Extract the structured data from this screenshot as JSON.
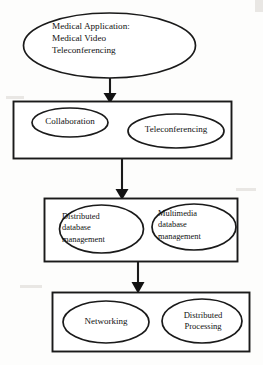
{
  "diagram": {
    "type": "flowchart",
    "orientation": "top-to-bottom",
    "title_node": "Medical Application: Medical Video Teleconferencing",
    "levels": [
      {
        "level": 1,
        "shape": "ellipse",
        "nodes": [
          {
            "id": "root-node",
            "label": "Medical Application:\nMedical Video\n Teleconferencing"
          }
        ]
      },
      {
        "level": 2,
        "shape": "rectangle-group",
        "nodes": [
          {
            "id": "collaboration",
            "label": "Collaboration"
          },
          {
            "id": "teleconferencing",
            "label": "Teleconferencing"
          }
        ]
      },
      {
        "level": 3,
        "shape": "rectangle-group",
        "nodes": [
          {
            "id": "distributed-db",
            "label": "Distributed\ndatabase\nmanagement"
          },
          {
            "id": "multimedia-db",
            "label": "Multimedia\ndatabase\nmanagement"
          }
        ]
      },
      {
        "level": 4,
        "shape": "rectangle-group",
        "nodes": [
          {
            "id": "networking",
            "label": "Networking"
          },
          {
            "id": "distributed-processing",
            "label": "Distributed\nProcessing"
          }
        ]
      }
    ],
    "connectors": [
      {
        "id": "arrow-1",
        "from": "root-node",
        "to": "level-2-group"
      },
      {
        "id": "arrow-2",
        "from": "level-2-group",
        "to": "level-3-group"
      },
      {
        "id": "arrow-3",
        "from": "level-3-group",
        "to": "level-4-group"
      }
    ],
    "colors": {
      "stroke": "#1a1a1a",
      "fill": "#ffffff",
      "background": "#fdfdfc",
      "text": "#111111"
    }
  }
}
